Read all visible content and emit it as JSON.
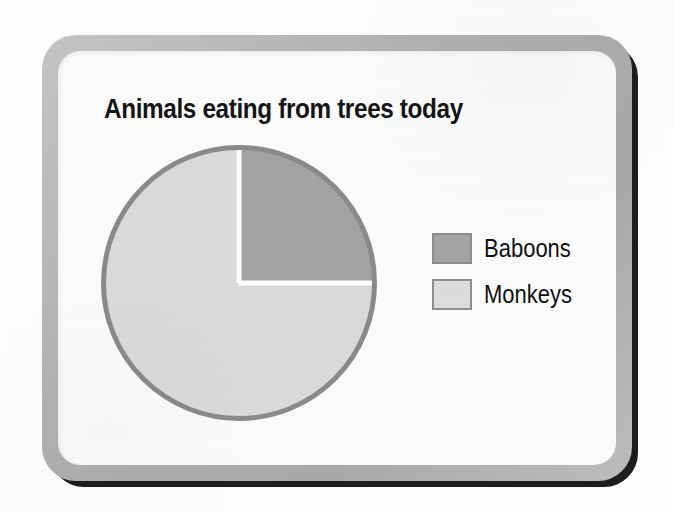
{
  "chart_data": {
    "type": "pie",
    "title": "Animals eating from trees today",
    "categories": [
      "Baboons",
      "Monkeys"
    ],
    "values": [
      25,
      75
    ],
    "unit": "percent",
    "legend_position": "right",
    "slice_colors": [
      "#a3a3a3",
      "#dadada"
    ],
    "outline_color": "#8a8a8a",
    "separator_color": "#ffffff",
    "start_angle_deg": 0,
    "direction": "clockwise",
    "grid": false,
    "xlabel": "",
    "ylabel": "",
    "annotations": []
  },
  "card": {
    "frame_color": "#b2b2b2",
    "shadow_color": "#1d1d1d",
    "inner_color": "#fbfbfb"
  },
  "legend": {
    "items": [
      {
        "label": "Baboons",
        "swatch_color": "#a3a3a3"
      },
      {
        "label": "Monkeys",
        "swatch_color": "#dcdcdc"
      }
    ]
  },
  "page": {
    "background_color": "#fdfdfd"
  }
}
